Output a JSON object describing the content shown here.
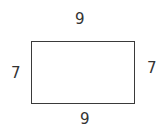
{
  "diagram": {
    "shape": "rectangle",
    "labels": {
      "top": "9",
      "bottom": "9",
      "left": "7",
      "right": "7"
    },
    "colors": {
      "stroke": "#3a3a3a",
      "text": "#333333",
      "background": "#ffffff"
    }
  }
}
